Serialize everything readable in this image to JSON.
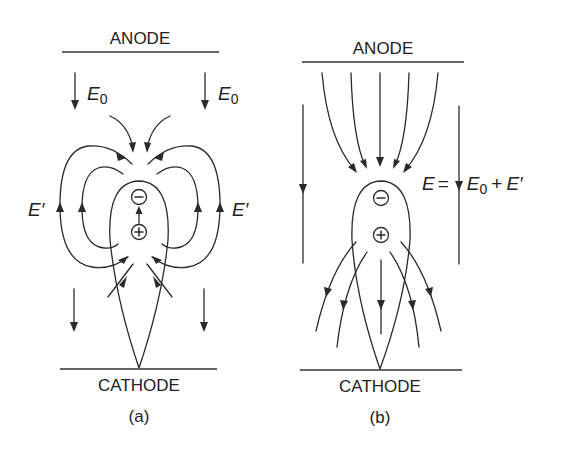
{
  "panels": [
    {
      "id": "a",
      "caption": "(a)",
      "anode_label": "ANODE",
      "cathode_label": "CATHODE",
      "field_labels": {
        "applied_left": {
          "symbol": "E",
          "subscript": "0"
        },
        "applied_right": {
          "symbol": "E",
          "subscript": "0"
        },
        "space_charge_left": "E′",
        "space_charge_right": "E′"
      },
      "charges": {
        "negative": "−",
        "positive": "+"
      }
    },
    {
      "id": "b",
      "caption": "(b)",
      "anode_label": "ANODE",
      "cathode_label": "CATHODE",
      "field_equation": {
        "lhs": "E",
        "equals": "=",
        "term1_symbol": "E",
        "term1_subscript": "0",
        "plus": "+",
        "term2": "E′"
      },
      "charges": {
        "negative": "−",
        "positive": "+"
      }
    }
  ],
  "colors": {
    "line": "#2a2a2a",
    "text": "#222222",
    "background": "#ffffff"
  }
}
